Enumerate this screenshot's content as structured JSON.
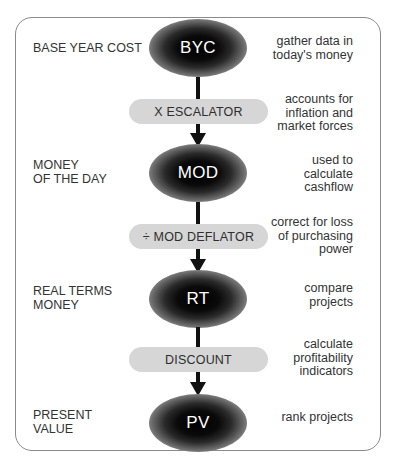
{
  "diagram": {
    "title": "",
    "stages": [
      {
        "node": "BYC",
        "left_label": [
          "BASE YEAR COST"
        ],
        "note": [
          "gather data in",
          "today's money"
        ]
      },
      {
        "node": "MOD",
        "left_label": [
          "MONEY",
          "OF THE DAY"
        ],
        "note": [
          "used to",
          "calculate",
          "cashflow"
        ]
      },
      {
        "node": "RT",
        "left_label": [
          "REAL TERMS",
          "MONEY"
        ],
        "note": [
          "compare",
          "projects"
        ]
      },
      {
        "node": "PV",
        "left_label": [
          "PRESENT",
          "VALUE"
        ],
        "note": [
          "rank projects"
        ]
      }
    ],
    "operations": [
      {
        "label": "X  ESCALATOR",
        "note": [
          "accounts for",
          "inflation and",
          "market  forces"
        ]
      },
      {
        "label": "÷ MOD DEFLATOR",
        "note": [
          "correct for loss",
          "of purchasing",
          "power"
        ]
      },
      {
        "label": "DISCOUNT",
        "note": [
          "calculate",
          "profitability",
          "indicators"
        ]
      }
    ],
    "colors": {
      "node_fill": "#000000",
      "node_text": "#ffffff",
      "pill_fill": "#d6d6d6",
      "connector": "#111111",
      "frame_border": "#8a8a8a",
      "text": "#333333"
    }
  }
}
